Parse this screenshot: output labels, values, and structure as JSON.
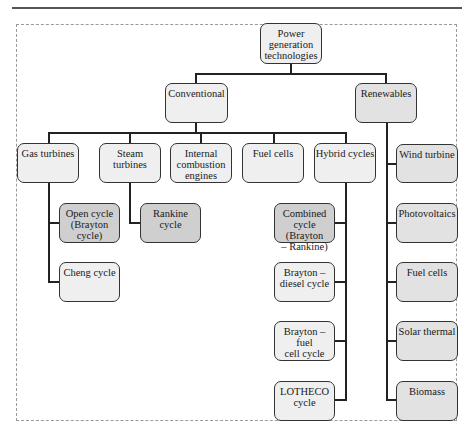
{
  "diagram": {
    "title_root": "Power\ngeneration\ntechnologies",
    "level1": {
      "conventional": "Conventional",
      "renewables": "Renewables"
    },
    "conventional_children": {
      "gas_turbines": "Gas turbines",
      "steam_turbines": "Steam\nturbines",
      "internal_combustion": "Internal\ncombustion\nengines",
      "fuel_cells": "Fuel cells",
      "hybrid_cycles": "Hybrid cycles"
    },
    "gas_turbine_children": {
      "open_cycle": "Open cycle\n(Brayton cycle)",
      "cheng_cycle": "Cheng cycle"
    },
    "steam_turbine_children": {
      "rankine_cycle": "Rankine cycle"
    },
    "hybrid_children": {
      "combined_cycle": "Combined\ncycle (Brayton\n– Rankine)",
      "brayton_diesel": "Brayton –\ndiesel cycle",
      "brayton_fuel_cell": "Brayton – fuel\ncell cycle",
      "lotheco": "LOTHECO\ncycle"
    },
    "renewables_children": {
      "wind_turbine": "Wind turbine",
      "photovoltaics": "Photovoltaics",
      "fuel_cells": "Fuel cells",
      "solar_thermal": "Solar thermal",
      "biomass": "Biomass"
    }
  },
  "colors": {
    "light_box": "#efefef",
    "mid_box": "#e2e2e2",
    "dark_box": "#cfcfcf",
    "connector": "#222222",
    "frame": "#9a9a9a"
  }
}
